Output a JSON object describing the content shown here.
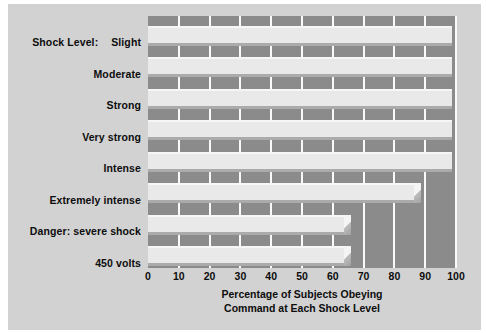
{
  "chart_data": {
    "type": "bar",
    "orientation": "horizontal",
    "title": "",
    "xlabel": "Percentage of Subjects Obeying Command at Each Shock Level",
    "xlabel_line1": "Percentage of Subjects Obeying",
    "xlabel_line2": "Command at Each Shock Level",
    "ylabel": "Shock Level:",
    "categories": [
      "Slight",
      "Moderate",
      "Strong",
      "Very strong",
      "Intense",
      "Extremely intense",
      "Danger: severe shock",
      "450 volts"
    ],
    "values": [
      100,
      100,
      100,
      100,
      100,
      87.5,
      65,
      65
    ],
    "xlim": [
      0,
      100
    ],
    "xticks": [
      0,
      10,
      20,
      30,
      40,
      50,
      60,
      70,
      80,
      90,
      100
    ],
    "xtick_labels": [
      "0",
      "10",
      "20",
      "30",
      "40",
      "50",
      "60",
      "70",
      "80",
      "90",
      "100"
    ],
    "grid": "vertical",
    "legend": "none",
    "colors": {
      "plot_background": "#8b8b8b",
      "bar_fill": "#e9e9e9",
      "gridline": "#fafafa",
      "panel_background": "#d2d2d2",
      "text": "#0d0d0d"
    }
  },
  "axis_label_prefix": "Shock Level:"
}
